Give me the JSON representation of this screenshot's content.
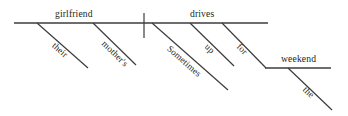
{
  "diagram": {
    "type": "reed-kellogg-sentence-diagram",
    "sentence": "Sometimes their mother's girlfriend drives up for the weekend.",
    "stroke_color": "#3c3c3c",
    "text_color": "#231f20",
    "background_color": "#ffffff",
    "labels": {
      "subject": "girlfriend",
      "verb": "drives",
      "subject_modifier_1": "their",
      "subject_modifier_2": "mother's",
      "verb_modifier_adverb": "Sometimes",
      "verb_modifier_particle": "up",
      "preposition": "for",
      "prep_object": "weekend",
      "prep_object_article": "the"
    },
    "lines": {
      "main_baseline": {
        "x1": 14,
        "y1": 23,
        "x2": 268,
        "y2": 23
      },
      "subject_verb_divider": {
        "x1": 144,
        "y1": 13,
        "x2": 144,
        "y2": 38
      },
      "prep_baseline": {
        "x1": 265,
        "y1": 68,
        "x2": 331,
        "y2": 68
      },
      "slants": [
        {
          "name": "their",
          "x1": 37,
          "y1": 23,
          "x2": 88,
          "y2": 68
        },
        {
          "name": "mothers",
          "x1": 93,
          "y1": 23,
          "x2": 136,
          "y2": 65
        },
        {
          "name": "sometimes",
          "x1": 152,
          "y1": 23,
          "x2": 228,
          "y2": 90
        },
        {
          "name": "up",
          "x1": 190,
          "y1": 23,
          "x2": 234,
          "y2": 66
        },
        {
          "name": "for",
          "x1": 222,
          "y1": 23,
          "x2": 266,
          "y2": 68
        },
        {
          "name": "the",
          "x1": 288,
          "y1": 68,
          "x2": 332,
          "y2": 110
        }
      ]
    }
  }
}
